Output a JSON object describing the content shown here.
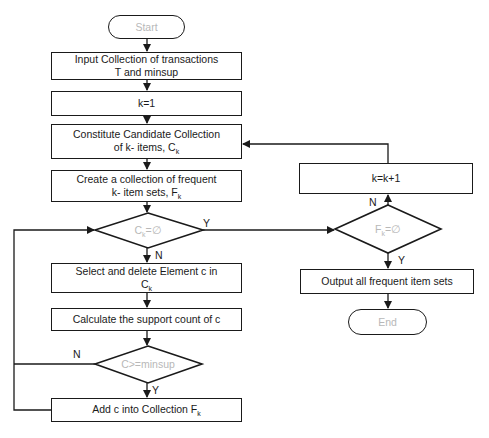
{
  "diagram": {
    "type": "flowchart",
    "title": "",
    "nodes": {
      "start": {
        "shape": "terminal",
        "label": "Start"
      },
      "input": {
        "shape": "process",
        "line1": "Input Collection of transactions",
        "line2": "T and minsup"
      },
      "init_k": {
        "shape": "process",
        "label": "k=1"
      },
      "constitute": {
        "shape": "process",
        "line1": "Constitute Candidate Collection",
        "line2": "of k- items, C",
        "sub": "k"
      },
      "create": {
        "shape": "process",
        "line1": "Create a collection of frequent",
        "line2": "k- item sets, F",
        "sub": "k"
      },
      "ck_empty": {
        "shape": "decision",
        "label": "C",
        "sub": "k",
        "suffix": "=∅"
      },
      "select": {
        "shape": "process",
        "line1": "Select and delete Element c in",
        "line2": "C",
        "sub": "k"
      },
      "calc": {
        "shape": "process",
        "label": "Calculate the support count of c"
      },
      "minsup_check": {
        "shape": "decision",
        "label": "C>=minsup"
      },
      "add": {
        "shape": "process",
        "label": "Add c into Collection F",
        "sub": "k"
      },
      "inc_k": {
        "shape": "process",
        "label": "k=k+1"
      },
      "fk_empty": {
        "shape": "decision",
        "label": "F",
        "sub": "k",
        "suffix": "=∅"
      },
      "output": {
        "shape": "process",
        "label": "Output all frequent item sets"
      },
      "end": {
        "shape": "terminal",
        "label": "End"
      }
    },
    "edge_labels": {
      "ck_empty_yes": "Y",
      "ck_empty_no": "N",
      "minsup_no": "N",
      "minsup_yes": "Y",
      "fk_empty_no": "N",
      "fk_empty_yes": "Y"
    },
    "edges": [
      {
        "from": "start",
        "to": "input"
      },
      {
        "from": "input",
        "to": "init_k"
      },
      {
        "from": "init_k",
        "to": "constitute"
      },
      {
        "from": "constitute",
        "to": "create"
      },
      {
        "from": "create",
        "to": "ck_empty"
      },
      {
        "from": "ck_empty",
        "to": "select",
        "label": "N"
      },
      {
        "from": "ck_empty",
        "to": "fk_empty",
        "label": "Y"
      },
      {
        "from": "select",
        "to": "calc"
      },
      {
        "from": "calc",
        "to": "minsup_check"
      },
      {
        "from": "minsup_check",
        "to": "add",
        "label": "Y"
      },
      {
        "from": "minsup_check",
        "to": "ck_empty",
        "label": "N"
      },
      {
        "from": "add",
        "to": "ck_empty"
      },
      {
        "from": "fk_empty",
        "to": "inc_k",
        "label": "N"
      },
      {
        "from": "fk_empty",
        "to": "output",
        "label": "Y"
      },
      {
        "from": "inc_k",
        "to": "constitute"
      },
      {
        "from": "output",
        "to": "end"
      }
    ],
    "colors": {
      "stroke": "#1a1a1a",
      "muted_text": "#b8b8b8",
      "background": "#ffffff"
    }
  }
}
